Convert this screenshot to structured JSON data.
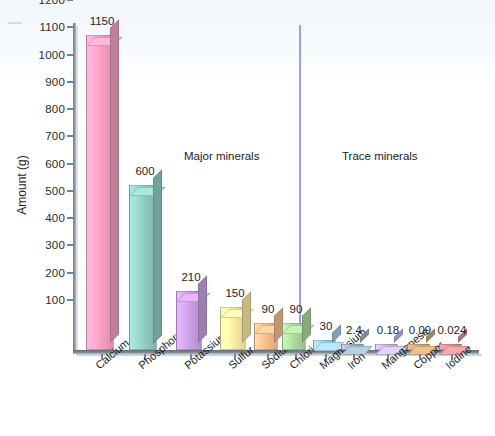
{
  "chart_data": {
    "type": "bar",
    "title": "",
    "xlabel": "",
    "ylabel": "Amount (g)",
    "ylim": [
      0,
      1200
    ],
    "ytick_labels": [
      "1200",
      "1100",
      "1000",
      "900",
      "800",
      "700",
      "600",
      "500",
      "400",
      "300",
      "200",
      "100"
    ],
    "ytick_values": [
      1200,
      1100,
      1000,
      900,
      800,
      700,
      600,
      500,
      400,
      300,
      200,
      100
    ],
    "grid": false,
    "legend": "none",
    "categories": [
      "Calcium",
      "Phosphorus",
      "Potassium",
      "Sulfur",
      "Sodium",
      "Chloride",
      "Magnesium",
      "Iron",
      "Manganese",
      "Copper",
      "Iodine"
    ],
    "values": [
      1150,
      600,
      210,
      150,
      90,
      90,
      30,
      2.4,
      0.18,
      0.09,
      0.024
    ],
    "value_labels": [
      "1150",
      "600",
      "210",
      "150",
      "90",
      "90",
      "30",
      "2.4",
      "0.18",
      "0.09",
      "0.024"
    ],
    "bar_colors": [
      "#f59ec0",
      "#8fc9c2",
      "#c79de0",
      "#f7e9a0",
      "#f5b98a",
      "#a9d49a",
      "#9ec8ea",
      "#9fb3c4",
      "#c3b6e0",
      "#cfa676",
      "#d98f93"
    ],
    "annotations": [
      {
        "text": "Major minerals",
        "group": [
          "Calcium",
          "Phosphorus",
          "Potassium",
          "Sulfur",
          "Sodium",
          "Chloride",
          "Magnesium"
        ]
      },
      {
        "text": "Trace minerals",
        "group": [
          "Iron",
          "Manganese",
          "Copper",
          "Iodine"
        ]
      }
    ],
    "divider": {
      "after_category": "Magnesium",
      "color": "#8f8fd4"
    }
  },
  "axis": {
    "y_title": "Amount (g)",
    "ticks": [
      "1200",
      "1100",
      "1000",
      "900",
      "800",
      "700",
      "600",
      "500",
      "400",
      "300",
      "200",
      "100"
    ]
  },
  "sections": {
    "major": "Major minerals",
    "trace": "Trace minerals"
  },
  "bars": [
    {
      "label": "Calcium",
      "value": "1150"
    },
    {
      "label": "Phosphorus",
      "value": "600"
    },
    {
      "label": "Potassium",
      "value": "210"
    },
    {
      "label": "Sulfur",
      "value": "150"
    },
    {
      "label": "Sodium",
      "value": "90"
    },
    {
      "label": "Chloride",
      "value": "90"
    },
    {
      "label": "Magnesium",
      "value": "30"
    },
    {
      "label": "Iron",
      "value": "2.4"
    },
    {
      "label": "Manganese",
      "value": "0.18"
    },
    {
      "label": "Copper",
      "value": "0.09"
    },
    {
      "label": "Iodine",
      "value": "0.024"
    }
  ]
}
